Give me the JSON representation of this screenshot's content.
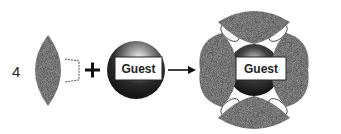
{
  "diagram": {
    "count_label": "4",
    "plus_symbol": "+",
    "guest_label": "Guest",
    "result_guest_label": "Guest",
    "components": [
      {
        "name": "lens-subunit",
        "quantity": "4"
      },
      {
        "name": "guest-sphere",
        "label": "Guest"
      },
      {
        "name": "assembled-capsule",
        "label": "Guest"
      }
    ],
    "colors": {
      "shell": "#3a3a3a",
      "shell_texture": "#6b6b6b",
      "label_box": "#ffffff",
      "line": "#111111"
    }
  }
}
